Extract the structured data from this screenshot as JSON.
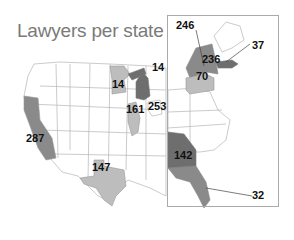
{
  "title": "Lawyers per state",
  "colors": {
    "high": "#8a8a8a",
    "mid": "#bdbdbd",
    "dark": "#6e6e6e",
    "border": "#aaaaaa",
    "none": "#ffffff"
  },
  "states": [
    {
      "state": "California",
      "value": "287"
    },
    {
      "state": "Texas",
      "value": "147"
    },
    {
      "state": "Minnesota",
      "value": "14"
    },
    {
      "state": "Michigan",
      "value": "14"
    },
    {
      "state": "Illinois",
      "value": "161"
    },
    {
      "state": "Ohio",
      "value": "253"
    },
    {
      "state": "Georgia",
      "value": "142"
    },
    {
      "state": "Florida",
      "value": "32"
    },
    {
      "state": "Pennsylvania",
      "value": "70"
    },
    {
      "state": "New York",
      "value": "236"
    },
    {
      "state": "New York (upstate pointer)",
      "value": "246"
    },
    {
      "state": "Massachusetts",
      "value": "37"
    }
  ]
}
